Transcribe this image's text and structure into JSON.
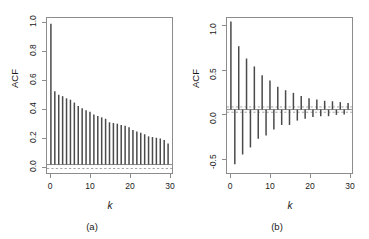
{
  "figure": {
    "background_color": "#ffffff",
    "bar_color": "#4a4a4a",
    "axis_color": "#8c8c8c",
    "zero_line_color": "#8c8c8c",
    "conf_line_color": "#9a9a9a"
  },
  "panels": [
    {
      "id": "a",
      "caption": "(a)",
      "ylabel": "ACF",
      "xlabel": "k"
    },
    {
      "id": "b",
      "caption": "(b)",
      "ylabel": "ACF",
      "xlabel": "k"
    }
  ],
  "chart_data": [
    {
      "type": "bar",
      "id": "panel-a",
      "title": "",
      "subtitle": "(a)",
      "xlabel": "k",
      "ylabel": "ACF",
      "xlim": [
        -1,
        31
      ],
      "ylim": [
        -0.06,
        1.04
      ],
      "xticks": [
        0,
        10,
        20,
        30
      ],
      "xticklabels": [
        "0",
        "10",
        "20",
        "30"
      ],
      "yticks": [
        0.0,
        0.2,
        0.4,
        0.6,
        0.8,
        1.0
      ],
      "yticklabels": [
        "0.0",
        "0.2",
        "0.4",
        "0.6",
        "0.8",
        "1.0"
      ],
      "grid": false,
      "legend": null,
      "zero_line": 0.0,
      "conf_lines": [
        -0.028
      ],
      "conf_line_style": "dashed",
      "x": [
        0,
        1,
        2,
        3,
        4,
        5,
        6,
        7,
        8,
        9,
        10,
        11,
        12,
        13,
        14,
        15,
        16,
        17,
        18,
        19,
        20,
        21,
        22,
        23,
        24,
        25,
        26,
        27,
        28,
        29,
        30
      ],
      "values": [
        1.0,
        0.52,
        0.495,
        0.485,
        0.47,
        0.46,
        0.44,
        0.415,
        0.4,
        0.385,
        0.375,
        0.355,
        0.345,
        0.335,
        0.325,
        0.3,
        0.295,
        0.29,
        0.28,
        0.275,
        0.265,
        0.245,
        0.235,
        0.225,
        0.215,
        0.2,
        0.195,
        0.19,
        0.185,
        0.175,
        0.15
      ],
      "categories": [
        "0",
        "1",
        "2",
        "3",
        "4",
        "5",
        "6",
        "7",
        "8",
        "9",
        "10",
        "11",
        "12",
        "13",
        "14",
        "15",
        "16",
        "17",
        "18",
        "19",
        "20",
        "21",
        "22",
        "23",
        "24",
        "25",
        "26",
        "27",
        "28",
        "29",
        "30"
      ]
    },
    {
      "type": "bar",
      "id": "panel-b",
      "title": "",
      "subtitle": "(b)",
      "xlabel": "k",
      "ylabel": "ACF",
      "xlim": [
        -1,
        31
      ],
      "ylim": [
        -0.72,
        1.04
      ],
      "xticks": [
        0,
        10,
        20,
        30
      ],
      "xticklabels": [
        "0",
        "10",
        "20",
        "30"
      ],
      "yticks": [
        -0.5,
        0.0,
        0.5,
        1.0
      ],
      "yticklabels": [
        "-0.5",
        "0.0",
        "0.5",
        "1.0"
      ],
      "grid": false,
      "legend": null,
      "zero_line": 0.0,
      "conf_lines": [
        0.03,
        -0.03
      ],
      "conf_line_style": "dashed",
      "x": [
        0,
        1,
        2,
        3,
        4,
        5,
        6,
        7,
        8,
        9,
        10,
        11,
        12,
        13,
        14,
        15,
        16,
        17,
        18,
        19,
        20,
        21,
        22,
        23,
        24,
        25,
        26,
        27,
        28,
        29,
        30
      ],
      "values": [
        1.0,
        -0.62,
        0.72,
        -0.51,
        0.58,
        -0.43,
        0.49,
        -0.33,
        0.39,
        -0.295,
        0.33,
        -0.225,
        0.26,
        -0.175,
        0.22,
        -0.175,
        0.19,
        -0.125,
        0.155,
        -0.105,
        0.13,
        -0.085,
        0.115,
        -0.075,
        0.1,
        -0.075,
        0.095,
        -0.06,
        0.085,
        -0.055,
        0.075
      ],
      "categories": [
        "0",
        "1",
        "2",
        "3",
        "4",
        "5",
        "6",
        "7",
        "8",
        "9",
        "10",
        "11",
        "12",
        "13",
        "14",
        "15",
        "16",
        "17",
        "18",
        "19",
        "20",
        "21",
        "22",
        "23",
        "24",
        "25",
        "26",
        "27",
        "28",
        "29",
        "30"
      ]
    }
  ]
}
